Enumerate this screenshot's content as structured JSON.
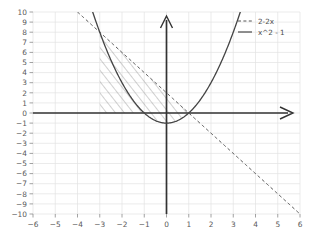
{
  "chart_data": {
    "type": "line",
    "title": "",
    "xlabel": "",
    "ylabel": "",
    "xlim": [
      -6,
      6
    ],
    "ylim": [
      -10,
      10
    ],
    "grid": true,
    "legend_position": "top-right",
    "xticks": [
      "-6",
      "-5",
      "-4",
      "-3",
      "-2",
      "-1",
      "0",
      "1",
      "2",
      "3",
      "4",
      "5",
      "6"
    ],
    "yticks": [
      "10",
      "9",
      "8",
      "7",
      "6",
      "5",
      "4",
      "3",
      "2",
      "1",
      "0",
      "-1",
      "-2",
      "-3",
      "-4",
      "-5",
      "-6",
      "-7",
      "-8",
      "-9",
      "-10"
    ],
    "xtick_values": [
      -6,
      -5,
      -4,
      -3,
      -2,
      -1,
      0,
      1,
      2,
      3,
      4,
      5,
      6
    ],
    "ytick_values": [
      10,
      9,
      8,
      7,
      6,
      5,
      4,
      3,
      2,
      1,
      0,
      -1,
      -2,
      -3,
      -4,
      -5,
      -6,
      -7,
      -8,
      -9,
      -10
    ],
    "series": [
      {
        "name": "2-2x",
        "label": "2-2x",
        "style": "dashed",
        "color": "#555555",
        "expression": "2-2*x",
        "x": [
          -4.0,
          -3.5,
          -3.0,
          -2.5,
          -2.0,
          -1.5,
          -1.0,
          -0.5,
          0.0,
          0.5,
          1.0,
          1.5,
          2.0,
          2.5,
          3.0,
          3.5,
          4.0,
          4.5,
          5.0,
          5.5,
          6.0
        ],
        "values": [
          10.0,
          9.0,
          8.0,
          7.0,
          6.0,
          5.0,
          4.0,
          3.0,
          2.0,
          1.0,
          0.0,
          -1.0,
          -2.0,
          -3.0,
          -4.0,
          -5.0,
          -6.0,
          -7.0,
          -8.0,
          -9.0,
          -10.0
        ]
      },
      {
        "name": "x^2 - 1",
        "label": "x^2 - 1",
        "style": "solid",
        "color": "#444444",
        "expression": "x^2-1",
        "x": [
          -3.3166,
          -3.0,
          -2.5,
          -2.0,
          -1.5,
          -1.0,
          -0.5,
          0.0,
          0.5,
          1.0,
          1.5,
          2.0,
          2.5,
          3.0,
          3.3166
        ],
        "values": [
          10.0,
          8.0,
          5.25,
          3.0,
          1.25,
          0.0,
          -0.75,
          -1.0,
          -0.75,
          0.0,
          1.25,
          3.0,
          5.25,
          8.0,
          10.0
        ]
      }
    ],
    "shaded_region": {
      "hatch": "diagonal",
      "x_from": -3,
      "x_to": 1,
      "upper_boundary": "2-2x",
      "lower_boundary_left": "y=0",
      "lower_boundary_right": "x^2-1",
      "color": "#777777"
    },
    "annotations": []
  },
  "legend": {
    "entries": [
      {
        "label": "2-2x",
        "style": "dashed"
      },
      {
        "label": "x^2 - 1",
        "style": "solid"
      }
    ]
  }
}
